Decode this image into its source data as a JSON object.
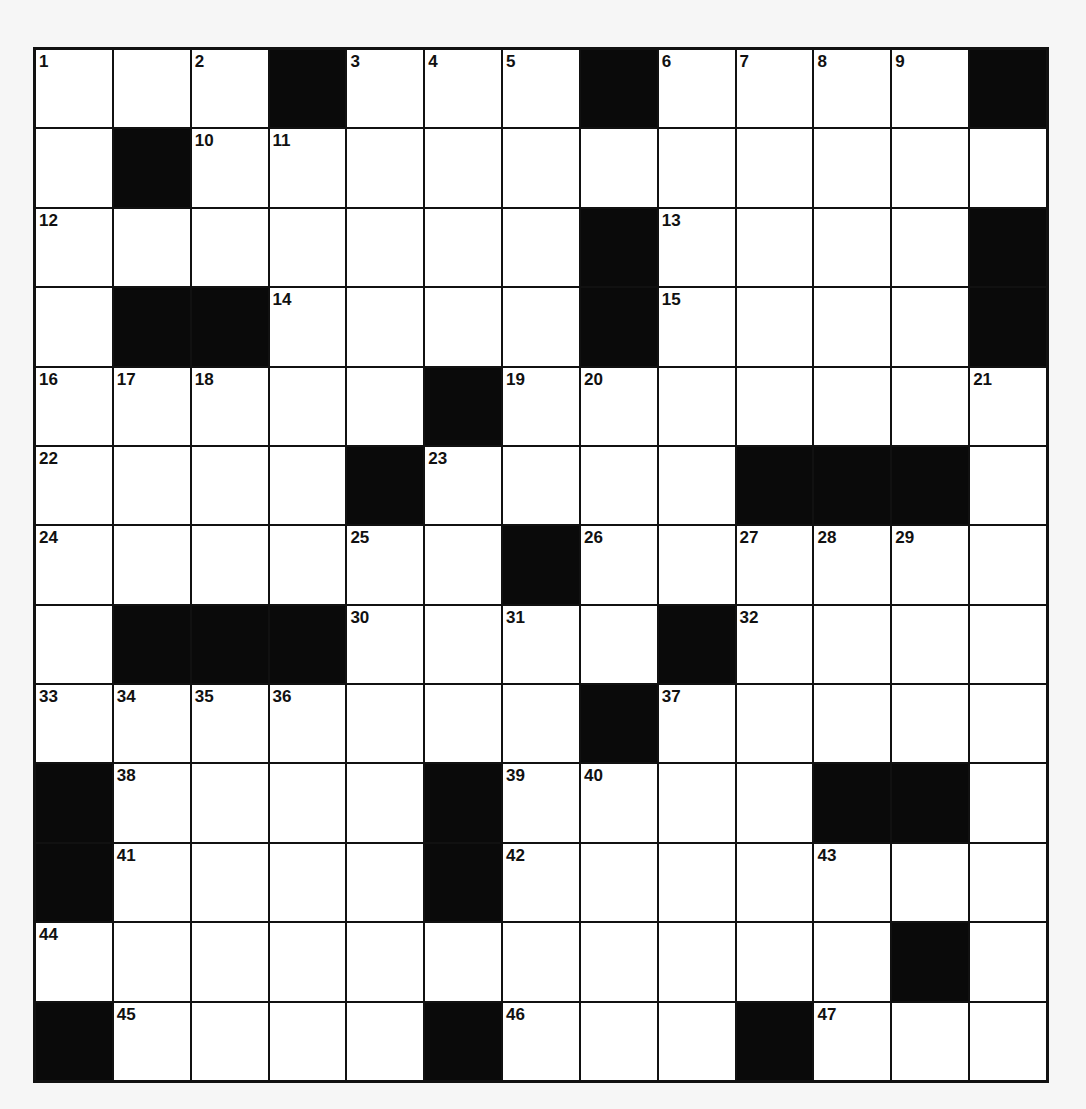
{
  "puzzle": {
    "rows": 13,
    "cols": 13,
    "colors": {
      "black_cell": "#0a0a0a",
      "white_cell": "#ffffff",
      "grid_line": "#111111",
      "background": "#f6f6f6"
    },
    "grid": [
      [
        "1",
        "",
        "2",
        "#",
        "3",
        "4",
        "5",
        "#",
        "6",
        "7",
        "8",
        "9",
        "#"
      ],
      [
        "",
        "#",
        "10",
        "11",
        "",
        "",
        "",
        "",
        "",
        "",
        "",
        "",
        ""
      ],
      [
        "12",
        "",
        "",
        "",
        "",
        "",
        "",
        "#",
        "13",
        "",
        "",
        "",
        "#"
      ],
      [
        "",
        "#",
        "#",
        "14",
        "",
        "",
        "",
        "#",
        "15",
        "",
        "",
        "",
        "#"
      ],
      [
        "16",
        "17",
        "18",
        "",
        "",
        "#",
        "19",
        "20",
        "",
        "",
        "",
        "",
        "21"
      ],
      [
        "22",
        "",
        "",
        "",
        "#",
        "23",
        "",
        "",
        "",
        "#",
        "#",
        "#",
        ""
      ],
      [
        "24",
        "",
        "",
        "",
        "25",
        "",
        "#",
        "26",
        "",
        "27",
        "28",
        "29",
        ""
      ],
      [
        "",
        "#",
        "#",
        "#",
        "30",
        "",
        "31",
        "",
        "#",
        "32",
        "",
        "",
        ""
      ],
      [
        "33",
        "34",
        "35",
        "36",
        "",
        "",
        "",
        "#",
        "37",
        "",
        "",
        "",
        ""
      ],
      [
        "#",
        "38",
        "",
        "",
        "",
        "#",
        "39",
        "40",
        "",
        "",
        "#",
        "#",
        ""
      ],
      [
        "#",
        "41",
        "",
        "",
        "",
        "#",
        "42",
        "",
        "",
        "",
        "43",
        "",
        ""
      ],
      [
        "44",
        "",
        "",
        "",
        "",
        "",
        "",
        "",
        "",
        "",
        "",
        "#",
        ""
      ],
      [
        "#",
        "45",
        "",
        "",
        "",
        "#",
        "46",
        "",
        "",
        "#",
        "47",
        "",
        ""
      ]
    ]
  }
}
